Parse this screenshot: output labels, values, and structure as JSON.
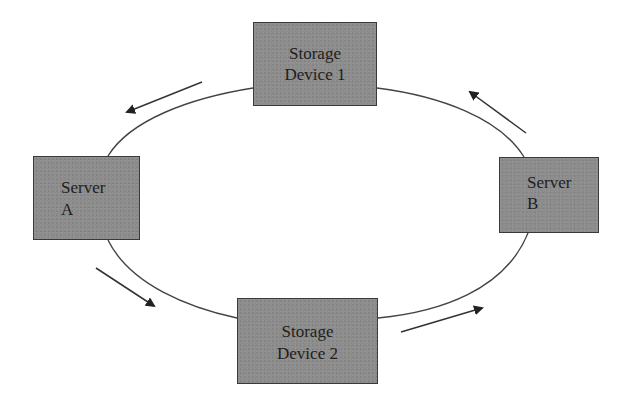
{
  "diagram": {
    "type": "ring-topology",
    "colors": {
      "node_fill": "#8c8c8c",
      "node_border": "#3a3a3a",
      "line": "#444444",
      "background": "#ffffff"
    },
    "nodes": [
      {
        "id": "storage1",
        "line1": "Storage",
        "line2": "Device 1"
      },
      {
        "id": "serverA",
        "line1": "Server",
        "line2": "A"
      },
      {
        "id": "serverB",
        "line1": "Server",
        "line2": "B"
      },
      {
        "id": "storage2",
        "line1": "Storage",
        "line2": "Device 2"
      }
    ],
    "edges": [
      {
        "from": "storage1",
        "to": "serverA",
        "direction": "counter-clockwise"
      },
      {
        "from": "serverA",
        "to": "storage2",
        "direction": "counter-clockwise"
      },
      {
        "from": "storage2",
        "to": "serverB",
        "direction": "counter-clockwise"
      },
      {
        "from": "serverB",
        "to": "storage1",
        "direction": "counter-clockwise"
      }
    ]
  }
}
